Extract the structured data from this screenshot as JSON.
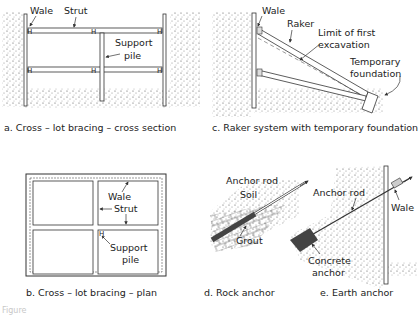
{
  "panels": {
    "a": {
      "caption": "a. Cross – lot bracing – cross section",
      "labels": {
        "wale": "Wale",
        "strut": "Strut",
        "support1": "Support",
        "support2": "pile"
      }
    },
    "b": {
      "caption": "b. Cross – lot bracing – plan",
      "labels": {
        "wale": "Wale",
        "strut": "Strut",
        "support1": "Support",
        "support2": "pile"
      }
    },
    "c": {
      "caption": "c. Raker system with temporary foundation",
      "labels": {
        "wale": "Wale",
        "raker": "Raker",
        "limit1": "Limit of first",
        "limit2": "excavation",
        "temp1": "Temporary",
        "temp2": "foundation"
      }
    },
    "d": {
      "caption": "d. Rock anchor",
      "labels": {
        "rod": "Anchor rod",
        "soil": "Soil",
        "grout": "Grout"
      }
    },
    "e": {
      "caption": "e. Earth anchor",
      "labels": {
        "rod": "Anchor rod",
        "wale": "Wale",
        "conc1": "Concrete",
        "conc2": "anchor"
      }
    }
  },
  "figure_label": "Figure"
}
